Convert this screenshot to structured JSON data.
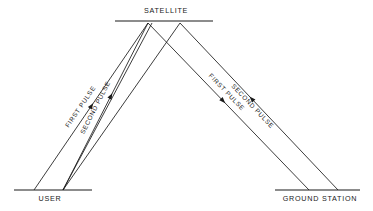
{
  "diagram": {
    "background_color": "#ffffff",
    "line_color": "#1a1a1a",
    "nodes": [
      {
        "id": "satellite",
        "label": "SATELLITE",
        "baseline": {
          "x1": 115,
          "y1": 21,
          "x2": 213,
          "y2": 21
        },
        "label_x": 166,
        "label_y": 13
      },
      {
        "id": "user",
        "label": "USER",
        "baseline": {
          "x1": 14,
          "y1": 190,
          "x2": 92,
          "y2": 190
        },
        "label_x": 50,
        "label_y": 201
      },
      {
        "id": "ground-station",
        "label": "GROUND STATION",
        "baseline": {
          "x1": 275,
          "y1": 190,
          "x2": 360,
          "y2": 190
        },
        "label_x": 320,
        "label_y": 201
      }
    ],
    "rays": [
      {
        "id": "ray-user-first-up",
        "label": "FIRST PULSE",
        "from": "user",
        "to": "satellite",
        "x1": 34,
        "y1": 190,
        "x2": 148,
        "y2": 23,
        "label_t": 0.47,
        "label_offset": -6.5,
        "arrow_t": 0.52,
        "arrow_dir": "forward"
      },
      {
        "id": "ray-user-second-up",
        "label": "SECOND PULSE",
        "from": "user",
        "to": "satellite",
        "x1": 63,
        "y1": 190,
        "x2": 148,
        "y2": 23,
        "label_t": 0.47,
        "label_offset": -6.5,
        "arrow_t": 0.58,
        "arrow_dir": "forward"
      },
      {
        "id": "ray-user-second-up-b",
        "label": "",
        "from": "user",
        "to": "satellite",
        "x1": 63,
        "y1": 190,
        "x2": 152,
        "y2": 23,
        "label_t": 0.5,
        "label_offset": 0,
        "arrow_t": -1,
        "arrow_dir": "none"
      },
      {
        "id": "ray-sat-first-down",
        "label": "FIRST PULSE",
        "from": "satellite",
        "to": "ground-station",
        "x1": 148,
        "y1": 23,
        "x2": 309,
        "y2": 190,
        "label_t": 0.45,
        "label_offset": -6.5,
        "arrow_t": 0.48,
        "arrow_dir": "forward"
      },
      {
        "id": "ray-ground-second-up",
        "label": "SECOND PULSE",
        "from": "ground-station",
        "to": "satellite",
        "x1": 338,
        "y1": 190,
        "x2": 180,
        "y2": 23,
        "label_t": 0.52,
        "label_offset": -6.5,
        "arrow_t": 0.56,
        "arrow_dir": "forward"
      },
      {
        "id": "ray-sat-left-down",
        "label": "",
        "from": "satellite",
        "to": "user",
        "x1": 180,
        "y1": 23,
        "x2": 63,
        "y2": 190,
        "label_t": 0.5,
        "label_offset": 0,
        "arrow_t": -1,
        "arrow_dir": "none"
      }
    ]
  }
}
